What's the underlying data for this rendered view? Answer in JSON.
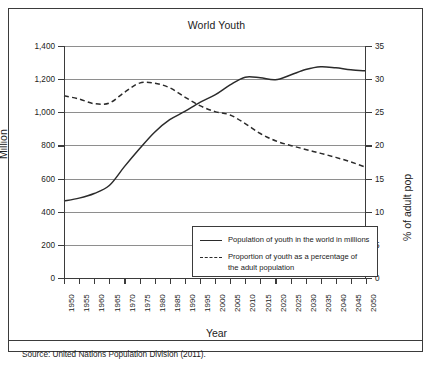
{
  "chart_data": {
    "type": "line",
    "title": "World Youth",
    "xlabel": "Year",
    "ylabel": "Million",
    "ylabel_right": "% of adult pop",
    "grid": true,
    "legend_position": "inside-bottom-right",
    "x": [
      1950,
      1955,
      1960,
      1965,
      1970,
      1975,
      1980,
      1985,
      1990,
      1995,
      2000,
      2005,
      2010,
      2015,
      2020,
      2025,
      2030,
      2035,
      2040,
      2045,
      2050
    ],
    "categories": [
      "1950",
      "1955",
      "1960",
      "1965",
      "1970",
      "1975",
      "1980",
      "1985",
      "1990",
      "1995",
      "2000",
      "2005",
      "2010",
      "2015",
      "2020",
      "2025",
      "2030",
      "2035",
      "2040",
      "2045",
      "2050"
    ],
    "ylim": [
      0,
      1400
    ],
    "yticks": [
      "0",
      "200",
      "400",
      "600",
      "800",
      "1,000",
      "1,200",
      "1,400"
    ],
    "ylim_right": [
      0,
      35
    ],
    "yticks_right": [
      "0",
      "5",
      "10",
      "15",
      "20",
      "25",
      "30",
      "35"
    ],
    "series": [
      {
        "name": "Population of youth in the world in millions",
        "axis": "left",
        "style": "solid",
        "values": [
          465,
          482,
          510,
          558,
          672,
          780,
          880,
          955,
          1005,
          1060,
          1105,
          1165,
          1212,
          1208,
          1196,
          1225,
          1258,
          1275,
          1268,
          1256,
          1250
        ]
      },
      {
        "name": "Proportion of youth as a percentage of the adult population",
        "axis": "right",
        "style": "dashed",
        "values": [
          27.5,
          27.0,
          26.3,
          26.4,
          28.0,
          29.4,
          29.4,
          28.7,
          27.3,
          26.0,
          25.1,
          24.6,
          23.3,
          21.8,
          20.7,
          20.0,
          19.4,
          18.8,
          18.2,
          17.5,
          16.7
        ]
      }
    ]
  },
  "legend": {
    "items": [
      {
        "label_line1": "Population of youth in the world in millions",
        "label_line2": "",
        "style": "solid"
      },
      {
        "label_line1": "Proportion of youth as a percentage of",
        "label_line2": "the adult population",
        "style": "dashed"
      }
    ]
  },
  "source": {
    "text": "Source: United Nations Population Division (2011)."
  },
  "colors": {
    "line": "#2b2b2b",
    "grid": "#8e8e8e",
    "axis": "#3b3b3b",
    "text": "#1a1a1a"
  }
}
